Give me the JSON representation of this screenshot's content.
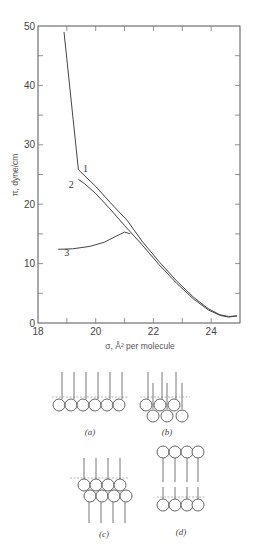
{
  "chart_data": {
    "type": "line",
    "title": "",
    "xlabel": "σ, Å² per molecule",
    "ylabel": "π, dyne/cm",
    "xlim": [
      18,
      25
    ],
    "ylim": [
      0,
      50
    ],
    "x_ticks": [
      18,
      20,
      22,
      24
    ],
    "x_minor_ticks": [
      19,
      21,
      23,
      25
    ],
    "y_ticks": [
      0,
      10,
      20,
      30,
      40,
      50
    ],
    "y_minor_ticks": [
      5,
      15,
      25,
      35,
      45
    ],
    "grid": false,
    "legend": "inline curve labels",
    "series": [
      {
        "name": "1",
        "label_pos": [
          19.65,
          25.5
        ],
        "x": [
          18.9,
          19.4,
          20.0,
          20.5,
          21.1,
          21.6,
          22.2,
          22.8,
          23.4,
          23.9,
          24.3,
          24.6,
          24.9
        ],
        "y": [
          49.0,
          25.8,
          23.0,
          20.3,
          17.2,
          13.8,
          10.3,
          7.1,
          4.3,
          2.4,
          1.4,
          1.1,
          1.2
        ]
      },
      {
        "name": "2",
        "label_pos": [
          19.15,
          22.8
        ],
        "x": [
          19.4,
          19.6,
          20.0,
          20.5,
          21.0,
          21.6,
          22.2,
          22.8,
          23.4,
          23.9,
          24.3,
          24.6,
          24.9
        ],
        "y": [
          24.2,
          23.5,
          21.8,
          19.2,
          16.4,
          13.2,
          9.8,
          6.7,
          4.0,
          2.2,
          1.3,
          1.0,
          1.2
        ]
      },
      {
        "name": "3",
        "label_pos": [
          19.0,
          11.2
        ],
        "x": [
          18.7,
          19.2,
          19.8,
          20.3,
          20.7,
          21.0,
          21.2
        ],
        "y": [
          12.4,
          12.5,
          12.9,
          13.6,
          14.6,
          15.3,
          15.0
        ]
      }
    ]
  },
  "diagrams": [
    {
      "id": "a",
      "label": "(a)",
      "description": "Monolayer: six molecules, heads in single row at interface, tails vertical"
    },
    {
      "id": "b",
      "label": "(b)",
      "description": "Staggered two-tier arrangement: three heads at interface, three heads submerged below"
    },
    {
      "id": "c",
      "label": "(c)",
      "description": "Bilayer-like collapse: four heads at interface with tails up, four heads beneath with tails down"
    },
    {
      "id": "d",
      "label": "(d)",
      "description": "Inverted bilayer: four heads on top, four heads at interface, tails joined in between"
    }
  ]
}
